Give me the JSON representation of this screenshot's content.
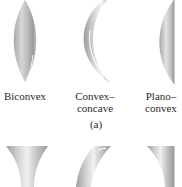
{
  "figure": {
    "panel_label": "(a)",
    "top_row": [
      {
        "name": "biconvex",
        "label_lines": [
          "Biconvex"
        ]
      },
      {
        "name": "convex-concave",
        "label_lines": [
          "Convex–",
          "concave"
        ]
      },
      {
        "name": "plano-convex",
        "label_lines": [
          "Plano–",
          "convex"
        ]
      }
    ],
    "bottom_row": [
      {
        "name": "biconcave"
      },
      {
        "name": "concave-convex"
      },
      {
        "name": "plano-concave"
      }
    ],
    "colors": {
      "lens_light": "#f2f2f2",
      "lens_mid": "#c4c4c4",
      "lens_dark": "#8a8a8a",
      "text": "#2a2a2a",
      "background": "#ffffff"
    }
  }
}
